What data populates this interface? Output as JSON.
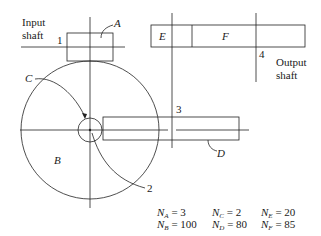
{
  "diagram": {
    "type": "gear train schematic",
    "labels": {
      "input_shaft_line1": "Input",
      "input_shaft_line2": "shaft",
      "output_shaft_line1": "Output",
      "output_shaft_line2": "shaft",
      "shaft_1": "1",
      "shaft_2": "2",
      "shaft_3": "3",
      "shaft_4": "4",
      "gear_A": "A",
      "gear_B": "B",
      "gear_C": "C",
      "gear_D": "D",
      "gear_E": "E",
      "gear_F": "F"
    },
    "teeth": [
      {
        "gear": "A",
        "symbol": "N",
        "sub": "A",
        "value": "= 3"
      },
      {
        "gear": "B",
        "symbol": "N",
        "sub": "B",
        "value": "= 100"
      },
      {
        "gear": "C",
        "symbol": "N",
        "sub": "C",
        "value": "= 2"
      },
      {
        "gear": "D",
        "symbol": "N",
        "sub": "D",
        "value": "= 80"
      },
      {
        "gear": "E",
        "symbol": "N",
        "sub": "E",
        "value": "= 20"
      },
      {
        "gear": "F",
        "symbol": "N",
        "sub": "F",
        "value": "= 85"
      }
    ],
    "line_color": "#222222"
  }
}
